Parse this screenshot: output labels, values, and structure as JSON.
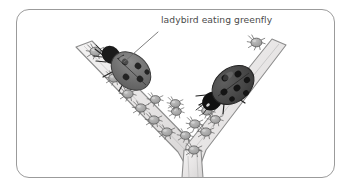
{
  "figure": {
    "title_label": "ladybird eating greenfly",
    "annotation": {
      "line1": "ladybird eating",
      "line2": "greenfly",
      "full_text": "ladybird eating greenfly",
      "text_color": "#4b4b4b"
    },
    "frame": {
      "border_color": "#9b9b9b",
      "background_color": "#ffffff",
      "corner_radius": 13
    },
    "scene": {
      "description": "V-shaped plant stem infested with greenfly aphids, with two ladybirds feeding on them",
      "stem": {
        "name": "plant-stem",
        "fill_color": "#eceaea",
        "outline_color": "#8f8f8f",
        "shape": "v-shaped-branch"
      },
      "ladybirds": [
        {
          "name": "ladybird-left",
          "body_color": "#6f6f6f",
          "head_color": "#1c1c1c",
          "spot_color": "#232323",
          "spot_count": 5
        },
        {
          "name": "ladybird-right",
          "body_color": "#4a4a4a",
          "head_color": "#141414",
          "spot_color": "#1a1a1a",
          "spot_count": 7
        }
      ],
      "aphids": {
        "name": "greenfly-aphids",
        "body_color": "#a9a9a9",
        "outline_color": "#636363",
        "count": 16
      },
      "leader_line": {
        "name": "annotation-leader-line",
        "color": "#6e6e6e"
      }
    }
  }
}
